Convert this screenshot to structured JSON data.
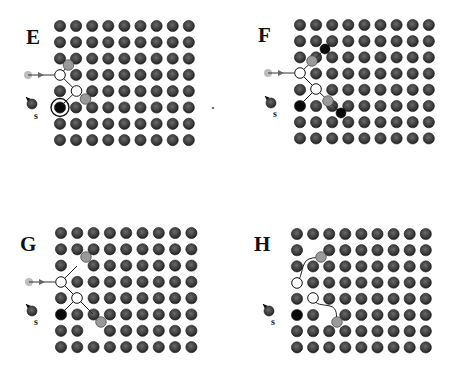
{
  "figure": {
    "colors": {
      "lattice_atom": "#3a3a3a",
      "lattice_atom_edge": "#1e1e1e",
      "dark_atom": "#0a0a0a",
      "gray_atom": "#9a9a9a",
      "light_gray": "#bdbdbd",
      "open_atom_fill": "#ffffff",
      "bond_line": "#222222",
      "background": "#ffffff"
    },
    "lattice": {
      "columns": 9,
      "rows": 8
    },
    "panels": [
      {
        "id": "E",
        "label": "E",
        "label_pos": [
          26,
          44
        ],
        "grid_origin": [
          60,
          26
        ],
        "spacing": [
          16.1,
          16.3
        ],
        "vacant_sites": [
          [
            0,
            3
          ],
          [
            1,
            4
          ]
        ],
        "dark_sites": [
          [
            0,
            5
          ]
        ],
        "ringed_sites": [
          [
            0,
            5
          ]
        ],
        "gray_atoms": [
          [
            68.5,
            65
          ],
          [
            85.5,
            99
          ]
        ],
        "open_atoms": [
          [
            60,
            75
          ],
          [
            76.5,
            91
          ]
        ],
        "bonds": [
          [
            [
              60,
              75
            ],
            [
              68.5,
              65
            ]
          ],
          [
            [
              60,
              75
            ],
            [
              76.5,
              91
            ]
          ],
          [
            [
              76.5,
              91
            ],
            [
              85.5,
              99
            ]
          ],
          [
            [
              76.5,
              91
            ],
            [
              62,
              105
            ]
          ]
        ],
        "incoming_arrow": {
          "from": [
            28,
            75
          ],
          "to": [
            58,
            75
          ]
        },
        "source": {
          "label": "s",
          "atom": [
            32,
            104
          ],
          "arrow_from": [
            32,
            104
          ],
          "arrow_to": [
            26,
            97
          ],
          "label_pos": [
            34,
            119
          ]
        },
        "stray_dot": [
          213,
          108
        ]
      },
      {
        "id": "F",
        "label": "F",
        "label_pos": [
          258,
          42
        ],
        "grid_origin": [
          300,
          25
        ],
        "spacing": [
          16.1,
          16.2
        ],
        "vacant_sites": [
          [
            0,
            3
          ],
          [
            1,
            4
          ]
        ],
        "dark_sites": [
          [
            0,
            5
          ]
        ],
        "ringed_sites": [],
        "gray_atoms": [
          [
            312,
            61
          ],
          [
            328,
            101
          ]
        ],
        "open_atoms": [
          [
            300,
            73
          ],
          [
            316,
            89
          ]
        ],
        "trail_atoms": [
          [
            325,
            49
          ],
          [
            341,
            113
          ]
        ],
        "bonds": [
          [
            [
              300,
              73
            ],
            [
              325,
              49
            ]
          ],
          [
            [
              300,
              73
            ],
            [
              316,
              89
            ]
          ],
          [
            [
              316,
              89
            ],
            [
              341,
              113
            ]
          ],
          [
            [
              316,
              89
            ],
            [
              302,
              103
            ]
          ]
        ],
        "incoming_arrow": {
          "from": [
            268,
            73
          ],
          "to": [
            298,
            73
          ]
        },
        "source": {
          "label": "s",
          "atom": [
            271,
            103
          ],
          "arrow_from": [
            271,
            103
          ],
          "arrow_to": [
            265,
            96
          ],
          "label_pos": [
            273,
            117
          ]
        }
      },
      {
        "id": "G",
        "label": "G",
        "label_pos": [
          20,
          251
        ],
        "grid_origin": [
          61,
          233
        ],
        "spacing": [
          16.3,
          16.3
        ],
        "vacant_sites": [
          [
            0,
            3
          ],
          [
            1,
            4
          ],
          [
            1,
            2
          ],
          [
            2,
            6
          ]
        ],
        "dark_sites": [
          [
            0,
            5
          ]
        ],
        "ringed_sites": [],
        "gray_atoms": [
          [
            86,
            257
          ],
          [
            101,
            322
          ]
        ],
        "open_atoms": [
          [
            61,
            282
          ],
          [
            77,
            298
          ]
        ],
        "bonds": [
          [
            [
              61,
              282
            ],
            [
              77,
              266
            ]
          ],
          [
            [
              61,
              282
            ],
            [
              77,
              298
            ]
          ],
          [
            [
              77,
              298
            ],
            [
              93,
              314
            ]
          ],
          [
            [
              77,
              298
            ],
            [
              63,
              312
            ]
          ]
        ],
        "incoming_arrow": {
          "from": [
            29,
            282
          ],
          "to": [
            59,
            282
          ]
        },
        "source": {
          "label": "s",
          "atom": [
            32,
            311
          ],
          "arrow_from": [
            32,
            311
          ],
          "arrow_to": [
            26,
            304
          ],
          "label_pos": [
            34,
            325
          ]
        }
      },
      {
        "id": "H",
        "label": "H",
        "label_pos": [
          254,
          251
        ],
        "grid_origin": [
          297,
          234
        ],
        "spacing": [
          16.1,
          16.2
        ],
        "vacant_sites": [
          [
            0,
            3
          ],
          [
            1,
            4
          ],
          [
            1,
            1
          ],
          [
            2,
            5
          ]
        ],
        "dark_sites": [
          [
            0,
            5
          ]
        ],
        "ringed_sites": [],
        "gray_atoms": [
          [
            321,
            257
          ],
          [
            337,
            322
          ]
        ],
        "open_atoms": [
          [
            297,
            283
          ],
          [
            313,
            298
          ]
        ],
        "curved_paths": [
          "M297,283 C303,276 301,262 309,259 C314,257 317,258 321,257",
          "M313,298 C316,306 322,304 330,306 C338,308 336,316 337,322"
        ],
        "source": {
          "label": "s",
          "atom": [
            269,
            311
          ],
          "arrow_from": [
            269,
            311
          ],
          "arrow_to": [
            263,
            304
          ],
          "label_pos": [
            271,
            325
          ]
        }
      }
    ]
  }
}
